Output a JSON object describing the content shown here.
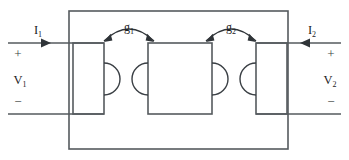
{
  "diagram": {
    "type": "circuit-schematic",
    "colors": {
      "line": "#555a5e",
      "text": "#1d2124",
      "background": "#ffffff"
    },
    "ports": {
      "left": {
        "current_label": "I",
        "current_subscript": "1",
        "current_direction": "right",
        "voltage_label": "V",
        "voltage_subscript": "1",
        "plus_sign": "+",
        "minus_sign": "−"
      },
      "right": {
        "current_label": "I",
        "current_subscript": "2",
        "current_direction": "left",
        "voltage_label": "V",
        "voltage_subscript": "2",
        "plus_sign": "+",
        "minus_sign": "−"
      }
    },
    "couplings": [
      {
        "label": "g",
        "subscript": "1",
        "between": "coil-1-and-coil-2",
        "arrow_style": "double-headed-arc"
      },
      {
        "label": "g",
        "subscript": "2",
        "between": "coil-2-and-coil-3",
        "arrow_style": "double-headed-arc"
      }
    ],
    "coils": [
      {
        "name": "coil-1",
        "position": "left",
        "bulge_side": "right"
      },
      {
        "name": "coil-2",
        "position": "middle",
        "bulge_side": "both"
      },
      {
        "name": "coil-3",
        "position": "right",
        "bulge_side": "left"
      }
    ],
    "enclosure": {
      "name": "network-enclosure",
      "shape": "rectangle"
    }
  }
}
